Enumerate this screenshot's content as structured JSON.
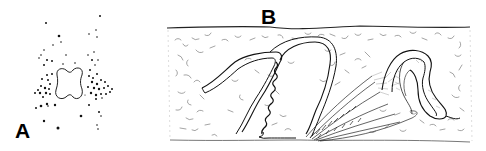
{
  "figure": {
    "panels": [
      {
        "id": "A",
        "label": "A",
        "description": "Stippled dot cluster surrounding a four-lobed outlined shape"
      },
      {
        "id": "B",
        "label": "B",
        "description": "Cross-section of textured tissue with folded bilayered lamellae and a striated fan-like structure"
      }
    ],
    "colors": {
      "ink": "#000000",
      "texture": "#555555",
      "background": "#ffffff"
    }
  }
}
